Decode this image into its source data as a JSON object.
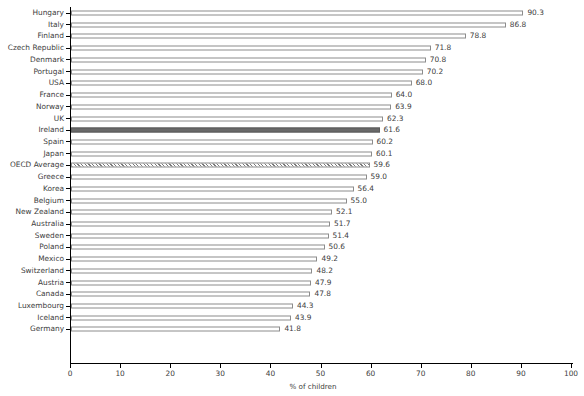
{
  "chart_data": {
    "type": "bar",
    "orientation": "horizontal",
    "title": "",
    "xlabel": "% of children",
    "ylabel": "",
    "xlim": [
      0,
      100
    ],
    "xticks": [
      0,
      10,
      20,
      30,
      40,
      50,
      60,
      70,
      80,
      90,
      100
    ],
    "grid": false,
    "legend": "none",
    "categories": [
      "Hungary",
      "Italy",
      "Finland",
      "Czech Republic",
      "Denmark",
      "Portugal",
      "USA",
      "France",
      "Norway",
      "UK",
      "Ireland",
      "Spain",
      "Japan",
      "OECD Average",
      "Greece",
      "Korea",
      "Belgium",
      "New Zealand",
      "Australia",
      "Sweden",
      "Poland",
      "Mexico",
      "Switzerland",
      "Austria",
      "Canada",
      "Luxembourg",
      "Iceland",
      "Germany"
    ],
    "values": [
      90.3,
      86.8,
      78.8,
      71.8,
      70.8,
      70.2,
      68.0,
      64.0,
      63.9,
      62.3,
      61.6,
      60.2,
      60.1,
      59.6,
      59.0,
      56.4,
      55.0,
      52.1,
      51.7,
      51.4,
      50.6,
      49.2,
      48.2,
      47.9,
      47.8,
      44.3,
      43.9,
      41.8
    ],
    "value_labels": [
      "90.3",
      "86.8",
      "78.8",
      "71.8",
      "70.8",
      "70.2",
      "68.0",
      "64.0",
      "63.9",
      "62.3",
      "61.6",
      "60.2",
      "60.1",
      "59.6",
      "59.0",
      "56.4",
      "55.0",
      "52.1",
      "51.7",
      "51.4",
      "50.6",
      "49.2",
      "48.2",
      "47.9",
      "47.8",
      "44.3",
      "43.9",
      "41.8"
    ],
    "styles": [
      "plain",
      "plain",
      "plain",
      "plain",
      "plain",
      "plain",
      "plain",
      "plain",
      "plain",
      "plain",
      "highlight",
      "plain",
      "plain",
      "hatched",
      "plain",
      "plain",
      "plain",
      "plain",
      "plain",
      "plain",
      "plain",
      "plain",
      "plain",
      "plain",
      "plain",
      "plain",
      "plain",
      "plain"
    ],
    "colors": {
      "bar_fill": "#ffffff",
      "bar_edge": "#8c8c8c",
      "highlight_fill": "#696969",
      "hatch_stroke": "#7a7a7a",
      "axis": "#000000",
      "text": "#404040"
    }
  }
}
